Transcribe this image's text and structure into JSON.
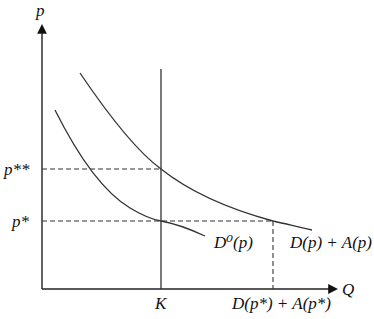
{
  "diagram": {
    "axes": {
      "y_label": "p",
      "x_label": "Q"
    },
    "price_levels": {
      "p_double_star": "p**",
      "p_star": "p*"
    },
    "quantity_marks": {
      "capacity": "K",
      "total_demand_at_p_star": "D(p*) + A(p*)"
    },
    "curves": {
      "base_demand": "D⁰(p)",
      "augmented_demand": "D(p) + A(p)"
    }
  }
}
